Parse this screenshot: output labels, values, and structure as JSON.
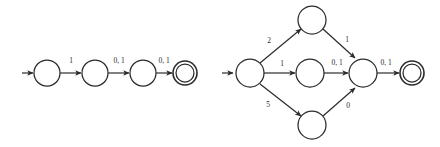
{
  "figure": {
    "background_color": "#ffffff",
    "stroke_color": "#2b2b2b",
    "label_color": "#2b2b2b"
  },
  "automata": [
    {
      "id": "left-automaton",
      "name": "linear-chain-automaton",
      "states": [
        {
          "id": "L0",
          "name": "state-L0",
          "cx": 47,
          "cy": 73,
          "r": 13,
          "accepting": false,
          "label": ""
        },
        {
          "id": "L1",
          "name": "state-L1",
          "cx": 95,
          "cy": 73,
          "r": 13,
          "accepting": false,
          "label": ""
        },
        {
          "id": "L2",
          "name": "state-L2",
          "cx": 143,
          "cy": 73,
          "r": 13,
          "accepting": false,
          "label": ""
        },
        {
          "id": "L3",
          "name": "state-L3-accept",
          "cx": 185,
          "cy": 73,
          "r": 12,
          "accepting": true,
          "label": ""
        }
      ],
      "start_arrow": {
        "name": "start-arrow-left",
        "x1": 22,
        "y1": 73,
        "x2": 34,
        "y2": 73
      },
      "transitions": [
        {
          "id": "L0-L1",
          "from": "L0",
          "to": "L1",
          "label": "1",
          "label_x": 71,
          "label_y": 63
        },
        {
          "id": "L1-L2",
          "from": "L1",
          "to": "L2",
          "label": "0, 1",
          "label_x": 119,
          "label_y": 63
        },
        {
          "id": "L2-L3",
          "from": "L2",
          "to": "L3",
          "label": "0, 1",
          "label_x": 164,
          "label_y": 63
        }
      ]
    },
    {
      "id": "right-automaton",
      "name": "diamond-branching-automaton",
      "states": [
        {
          "id": "R0",
          "name": "state-R0-start",
          "cx": 250,
          "cy": 73,
          "r": 14,
          "accepting": false,
          "label": ""
        },
        {
          "id": "RT",
          "name": "state-RT-top",
          "cx": 312,
          "cy": 20,
          "r": 14,
          "accepting": false,
          "label": ""
        },
        {
          "id": "RM",
          "name": "state-RM-middle",
          "cx": 310,
          "cy": 73,
          "r": 14,
          "accepting": false,
          "label": ""
        },
        {
          "id": "RB",
          "name": "state-RB-bottom",
          "cx": 312,
          "cy": 125,
          "r": 14,
          "accepting": false,
          "label": ""
        },
        {
          "id": "RJ",
          "name": "state-RJ-join",
          "cx": 363,
          "cy": 73,
          "r": 14,
          "accepting": false,
          "label": ""
        },
        {
          "id": "RA",
          "name": "state-RA-accept",
          "cx": 412,
          "cy": 73,
          "r": 12,
          "accepting": true,
          "label": ""
        }
      ],
      "start_arrow": {
        "name": "start-arrow-right",
        "x1": 222,
        "y1": 73,
        "x2": 234,
        "y2": 73
      },
      "transitions": [
        {
          "id": "R0-RT",
          "from": "R0",
          "to": "RT",
          "label": "2",
          "label_x": 269,
          "label_y": 43
        },
        {
          "id": "R0-RM",
          "from": "R0",
          "to": "RM",
          "label": "1",
          "label_x": 282,
          "label_y": 66
        },
        {
          "id": "R0-RB",
          "from": "R0",
          "to": "RB",
          "label": "5",
          "label_x": 268,
          "label_y": 107
        },
        {
          "id": "RT-RJ",
          "from": "RT",
          "to": "RJ",
          "label": "1",
          "label_x": 347,
          "label_y": 42
        },
        {
          "id": "RM-RJ",
          "from": "RM",
          "to": "RJ",
          "label": "0, 1",
          "label_x": 337,
          "label_y": 65
        },
        {
          "id": "RB-RJ",
          "from": "RB",
          "to": "RJ",
          "label": "0",
          "label_x": 348,
          "label_y": 108
        },
        {
          "id": "RJ-RA",
          "from": "RJ",
          "to": "RA",
          "label": "0, 1",
          "label_x": 386,
          "label_y": 65
        }
      ]
    }
  ]
}
